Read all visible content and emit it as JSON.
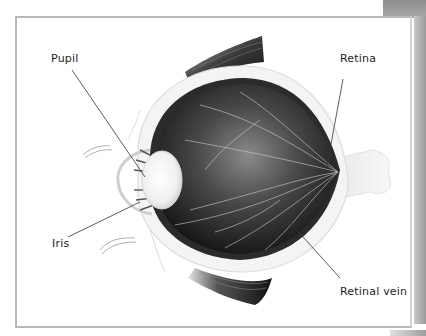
{
  "diagram": {
    "labels": [
      {
        "id": "pupil",
        "text": "Pupil"
      },
      {
        "id": "retina",
        "text": "Retina"
      },
      {
        "id": "iris",
        "text": "Iris"
      },
      {
        "id": "retinal-vein",
        "text": "Retinal vein"
      }
    ],
    "colors": {
      "frame_border": "#b9b9b9",
      "label_text": "#1e1e1e",
      "leader_line": "#333333",
      "eye_interior_dark": "#1a1a1a",
      "sclera": "#f2f2f2"
    }
  }
}
